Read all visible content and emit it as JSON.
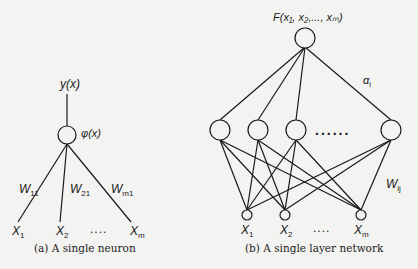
{
  "figure_a": {
    "output_label": "y(x)",
    "activation_label": "φ(x)",
    "weights": [
      {
        "base": "W",
        "sub": "11"
      },
      {
        "base": "W",
        "sub": "21"
      },
      {
        "base": "W",
        "sub": "m1"
      }
    ],
    "inputs": [
      {
        "base": "X",
        "sub": "1"
      },
      {
        "base": "X",
        "sub": "2"
      },
      {
        "base": "X",
        "sub": "m"
      }
    ],
    "ellipsis": "....",
    "caption": "(a) A single neuron"
  },
  "figure_b": {
    "output_label": "F(x₁, x₂,..., xₘ)",
    "alpha_label": {
      "base": "α",
      "sub": "i"
    },
    "weight_label": {
      "base": "W",
      "sub": "ij"
    },
    "hidden_ellipsis": "......",
    "inputs": [
      {
        "base": "X",
        "sub": "1"
      },
      {
        "base": "X",
        "sub": "2"
      },
      {
        "base": "X",
        "sub": "m"
      }
    ],
    "input_ellipsis": "....",
    "caption": "(b) A single layer network"
  }
}
